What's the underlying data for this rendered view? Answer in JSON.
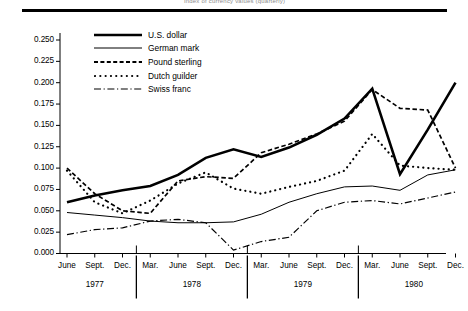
{
  "figure": {
    "title": "Index of currency values (quarterly)",
    "top_rule": "horizontal-rule"
  },
  "chart_data": {
    "type": "line",
    "title": "Index of currency values (quarterly)",
    "xlabel": "",
    "ylabel": "",
    "ylim": [
      0.0,
      0.26
    ],
    "grid": false,
    "legend_position": "upper-left-inside",
    "y_ticks": [
      "0.000",
      "0.025",
      "0.050",
      "0.075",
      "0.100",
      "0.125",
      "0.150",
      "0.175",
      "0.200",
      "0.225",
      "0.250"
    ],
    "y_tick_values": [
      0.0,
      0.025,
      0.05,
      0.075,
      0.1,
      0.125,
      0.15,
      0.175,
      0.2,
      0.225,
      0.25
    ],
    "x": [
      "June",
      "Sept.",
      "Dec.",
      "Mar.",
      "June",
      "Sept.",
      "Dec.",
      "Mar.",
      "June",
      "Sept.",
      "Dec.",
      "Mar.",
      "June",
      "Sept.",
      "Dec."
    ],
    "year_groups": [
      {
        "label": "1977",
        "start_index": 0,
        "end_index": 2
      },
      {
        "label": "1978",
        "start_index": 3,
        "end_index": 6
      },
      {
        "label": "1979",
        "start_index": 7,
        "end_index": 10
      },
      {
        "label": "1980",
        "start_index": 11,
        "end_index": 14
      }
    ],
    "series": [
      {
        "name": "U.S. dollar",
        "style": "solid-thick",
        "values": [
          0.06,
          0.068,
          0.074,
          0.079,
          0.092,
          0.112,
          0.122,
          0.113,
          0.124,
          0.139,
          0.158,
          0.193,
          0.093,
          0.145,
          0.2
        ]
      },
      {
        "name": "German mark",
        "style": "solid-thin",
        "values": [
          0.048,
          0.045,
          0.042,
          0.038,
          0.036,
          0.036,
          0.037,
          0.046,
          0.06,
          0.07,
          0.078,
          0.079,
          0.074,
          0.092,
          0.098
        ]
      },
      {
        "name": "Pound sterling",
        "style": "dashed",
        "values": [
          0.1,
          0.07,
          0.05,
          0.047,
          0.085,
          0.09,
          0.088,
          0.118,
          0.128,
          0.14,
          0.155,
          0.192,
          0.17,
          0.168,
          0.1
        ]
      },
      {
        "name": "Dutch guilder",
        "style": "dotted",
        "values": [
          0.097,
          0.06,
          0.047,
          0.062,
          0.082,
          0.095,
          0.076,
          0.07,
          0.078,
          0.085,
          0.097,
          0.14,
          0.103,
          0.1,
          0.098
        ]
      },
      {
        "name": "Swiss franc",
        "style": "dash-dot",
        "values": [
          0.022,
          0.028,
          0.03,
          0.038,
          0.04,
          0.036,
          0.004,
          0.014,
          0.019,
          0.05,
          0.06,
          0.062,
          0.058,
          0.065,
          0.072
        ]
      }
    ]
  }
}
